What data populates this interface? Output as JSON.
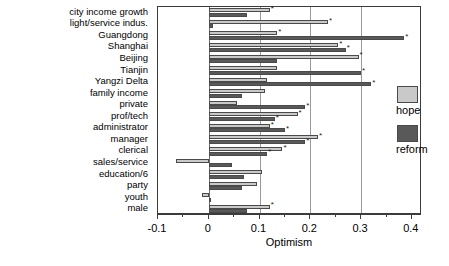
{
  "chart_data": {
    "type": "bar",
    "orientation": "horizontal",
    "title": "",
    "xlabel": "Optimism",
    "ylabel": "",
    "xlim": [
      -0.1,
      0.42
    ],
    "xticks": [
      -0.1,
      0,
      0.1,
      0.2,
      0.3,
      0.4
    ],
    "xticklabels": [
      "-0.1",
      "0",
      "0.1",
      "0.2",
      "0.3",
      "0.4"
    ],
    "grid": "vertical gridlines at 0.1, 0.2, 0.3; zero reference line at 0",
    "legend_position": "right",
    "categories": [
      "city income growth",
      "light/service indus.",
      "Guangdong",
      "Shanghai",
      "Beijing",
      "Tianjin",
      "Yangzi Delta",
      "family income",
      "private",
      "prof/tech",
      "administrator",
      "manager",
      "clerical",
      "sales/service",
      "education/6",
      "party",
      "youth",
      "male"
    ],
    "series": [
      {
        "name": "hope",
        "color": "#c9c9c9",
        "values": [
          0.12,
          0.235,
          0.135,
          0.255,
          0.295,
          0.135,
          0.115,
          0.11,
          0.055,
          0.175,
          0.12,
          0.215,
          0.145,
          -0.065,
          0.105,
          0.095,
          -0.013,
          0.12
        ],
        "significant": [
          true,
          true,
          true,
          true,
          true,
          false,
          false,
          false,
          false,
          true,
          true,
          true,
          true,
          false,
          false,
          false,
          false,
          true
        ]
      },
      {
        "name": "reform",
        "color": "#595959",
        "values": [
          0.075,
          0.008,
          0.385,
          0.27,
          0.135,
          0.3,
          0.32,
          0.065,
          0.19,
          0.13,
          0.15,
          0.19,
          0.115,
          0.045,
          0.07,
          0.065,
          0.0,
          0.075
        ],
        "significant": [
          false,
          false,
          true,
          true,
          false,
          true,
          true,
          false,
          true,
          true,
          true,
          true,
          true,
          false,
          false,
          false,
          false,
          false
        ]
      }
    ],
    "legend": [
      "hope",
      "reform"
    ],
    "annotation": "* marks statistically significant coefficients"
  }
}
